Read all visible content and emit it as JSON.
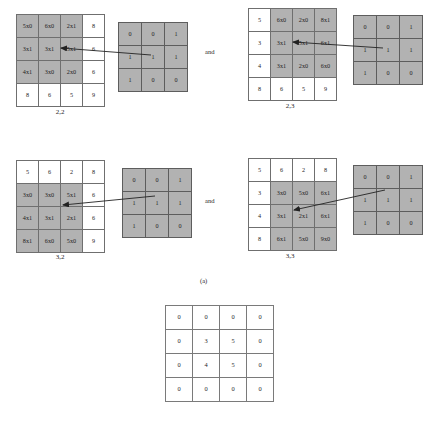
{
  "figure": {
    "subfigure_label": "(a)",
    "conjunction_label_1": "and",
    "conjunction_label_2": "and"
  },
  "panels": [
    {
      "id": "panel-2-2",
      "caption": "2,2",
      "image_grid": {
        "rows": [
          [
            {
              "text": "5x0",
              "shaded": true
            },
            {
              "text": "6x0",
              "shaded": true
            },
            {
              "text": "2x1",
              "shaded": true
            },
            {
              "text": "8",
              "shaded": false
            }
          ],
          [
            {
              "text": "3x1",
              "shaded": true
            },
            {
              "text": "3x1",
              "shaded": true
            },
            {
              "text": "5x1",
              "shaded": true
            },
            {
              "text": "6",
              "shaded": false
            }
          ],
          [
            {
              "text": "4x1",
              "shaded": true
            },
            {
              "text": "3x0",
              "shaded": true
            },
            {
              "text": "2x0",
              "shaded": true
            },
            {
              "text": "6",
              "shaded": false
            }
          ],
          [
            {
              "text": "8",
              "shaded": false
            },
            {
              "text": "6",
              "shaded": false
            },
            {
              "text": "5",
              "shaded": false
            },
            {
              "text": "9",
              "shaded": false
            }
          ]
        ]
      },
      "kernel_grid": {
        "rows": [
          [
            "0",
            "0",
            "1"
          ],
          [
            "1",
            "1",
            "1"
          ],
          [
            "1",
            "0",
            "0"
          ]
        ]
      }
    },
    {
      "id": "panel-2-3",
      "caption": "2,3",
      "image_grid": {
        "rows": [
          [
            {
              "text": "5",
              "shaded": false
            },
            {
              "text": "6x0",
              "shaded": true
            },
            {
              "text": "2x0",
              "shaded": true
            },
            {
              "text": "8x1",
              "shaded": true
            }
          ],
          [
            {
              "text": "3",
              "shaded": false
            },
            {
              "text": "3x1",
              "shaded": true
            },
            {
              "text": "5x1",
              "shaded": true
            },
            {
              "text": "6x1",
              "shaded": true
            }
          ],
          [
            {
              "text": "4",
              "shaded": false
            },
            {
              "text": "3x1",
              "shaded": true
            },
            {
              "text": "2x0",
              "shaded": true
            },
            {
              "text": "6x0",
              "shaded": true
            }
          ],
          [
            {
              "text": "8",
              "shaded": false
            },
            {
              "text": "6",
              "shaded": false
            },
            {
              "text": "5",
              "shaded": false
            },
            {
              "text": "9",
              "shaded": false
            }
          ]
        ]
      },
      "kernel_grid": {
        "rows": [
          [
            "0",
            "0",
            "1"
          ],
          [
            "1",
            "1",
            "1"
          ],
          [
            "1",
            "0",
            "0"
          ]
        ]
      }
    },
    {
      "id": "panel-3-2",
      "caption": "3,2",
      "image_grid": {
        "rows": [
          [
            {
              "text": "5",
              "shaded": false
            },
            {
              "text": "6",
              "shaded": false
            },
            {
              "text": "2",
              "shaded": false
            },
            {
              "text": "8",
              "shaded": false
            }
          ],
          [
            {
              "text": "3x0",
              "shaded": true
            },
            {
              "text": "3x0",
              "shaded": true
            },
            {
              "text": "5x1",
              "shaded": true
            },
            {
              "text": "6",
              "shaded": false
            }
          ],
          [
            {
              "text": "4x1",
              "shaded": true
            },
            {
              "text": "3x1",
              "shaded": true
            },
            {
              "text": "2x1",
              "shaded": true
            },
            {
              "text": "6",
              "shaded": false
            }
          ],
          [
            {
              "text": "8x1",
              "shaded": true
            },
            {
              "text": "6x0",
              "shaded": true
            },
            {
              "text": "5x0",
              "shaded": true
            },
            {
              "text": "9",
              "shaded": false
            }
          ]
        ]
      },
      "kernel_grid": {
        "rows": [
          [
            "0",
            "0",
            "1"
          ],
          [
            "1",
            "1",
            "1"
          ],
          [
            "1",
            "0",
            "0"
          ]
        ]
      }
    },
    {
      "id": "panel-3-3",
      "caption": "3,3",
      "image_grid": {
        "rows": [
          [
            {
              "text": "5",
              "shaded": false
            },
            {
              "text": "6",
              "shaded": false
            },
            {
              "text": "2",
              "shaded": false
            },
            {
              "text": "8",
              "shaded": false
            }
          ],
          [
            {
              "text": "3",
              "shaded": false
            },
            {
              "text": "3x0",
              "shaded": true
            },
            {
              "text": "5x0",
              "shaded": true
            },
            {
              "text": "6x1",
              "shaded": true
            }
          ],
          [
            {
              "text": "4",
              "shaded": false
            },
            {
              "text": "3x1",
              "shaded": true
            },
            {
              "text": "2x1",
              "shaded": true
            },
            {
              "text": "6x1",
              "shaded": true
            }
          ],
          [
            {
              "text": "8",
              "shaded": false
            },
            {
              "text": "6x1",
              "shaded": true
            },
            {
              "text": "5x0",
              "shaded": true
            },
            {
              "text": "9x0",
              "shaded": true
            }
          ]
        ]
      },
      "kernel_grid": {
        "rows": [
          [
            "0",
            "0",
            "1"
          ],
          [
            "1",
            "1",
            "1"
          ],
          [
            "1",
            "0",
            "0"
          ]
        ]
      }
    }
  ],
  "output_grid": {
    "rows": [
      [
        "0",
        "0",
        "0",
        "0"
      ],
      [
        "0",
        "3",
        "5",
        "0"
      ],
      [
        "0",
        "4",
        "5",
        "0"
      ],
      [
        "0",
        "0",
        "0",
        "0"
      ]
    ]
  },
  "colors": {
    "shaded_cell": "#b2b2b2",
    "cell_border": "#6f6f6f",
    "text": "#1f1f1f",
    "arrow": "#222222"
  }
}
